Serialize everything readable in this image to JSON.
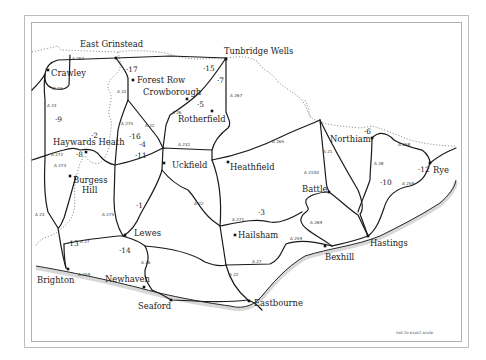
{
  "map": {
    "title": "East Sussex area map",
    "scale_note": "not to exact scale",
    "towns": [
      {
        "name": "East Grinstead",
        "x": 80,
        "y": 47
      },
      {
        "name": "Tunbridge Wells",
        "x": 224,
        "y": 54
      },
      {
        "name": "Crawley",
        "x": 51,
        "y": 76
      },
      {
        "name": "Forest Row",
        "x": 137,
        "y": 83
      },
      {
        "name": "Crowborough",
        "x": 143,
        "y": 95
      },
      {
        "name": "Rotherfield",
        "x": 178,
        "y": 122
      },
      {
        "name": "Haywards Heath",
        "x": 53,
        "y": 145
      },
      {
        "name": "Uckfield",
        "x": 172,
        "y": 168
      },
      {
        "name": "Heathfield",
        "x": 230,
        "y": 170
      },
      {
        "name": "Burgess",
        "x": 73,
        "y": 183
      },
      {
        "name": "Hill",
        "x": 82,
        "y": 193
      },
      {
        "name": "Northiam",
        "x": 330,
        "y": 142
      },
      {
        "name": "Rye",
        "x": 433,
        "y": 173
      },
      {
        "name": "Battle",
        "x": 302,
        "y": 192
      },
      {
        "name": "Lewes",
        "x": 134,
        "y": 236
      },
      {
        "name": "Hailsham",
        "x": 238,
        "y": 238
      },
      {
        "name": "Hastings",
        "x": 370,
        "y": 246
      },
      {
        "name": "Bexhill",
        "x": 325,
        "y": 260
      },
      {
        "name": "Brighton",
        "x": 37,
        "y": 283
      },
      {
        "name": "Newhaven",
        "x": 105,
        "y": 282
      },
      {
        "name": "Seaford",
        "x": 138,
        "y": 309
      },
      {
        "name": "Eastbourne",
        "x": 254,
        "y": 306
      }
    ],
    "town_markers": [
      {
        "x": 116,
        "y": 58
      },
      {
        "x": 226,
        "y": 59
      },
      {
        "x": 48,
        "y": 70
      },
      {
        "x": 133,
        "y": 80
      },
      {
        "x": 187,
        "y": 99
      },
      {
        "x": 212,
        "y": 111
      },
      {
        "x": 86,
        "y": 152
      },
      {
        "x": 164,
        "y": 163
      },
      {
        "x": 228,
        "y": 162
      },
      {
        "x": 70,
        "y": 176
      },
      {
        "x": 372,
        "y": 138
      },
      {
        "x": 430,
        "y": 163
      },
      {
        "x": 329,
        "y": 192
      },
      {
        "x": 125,
        "y": 235
      },
      {
        "x": 235,
        "y": 235
      },
      {
        "x": 368,
        "y": 236
      },
      {
        "x": 325,
        "y": 246
      },
      {
        "x": 68,
        "y": 269
      },
      {
        "x": 144,
        "y": 287
      },
      {
        "x": 171,
        "y": 300
      },
      {
        "x": 249,
        "y": 301
      }
    ],
    "numbers": [
      {
        "label": "1",
        "x": 136,
        "y": 208
      },
      {
        "label": "2",
        "x": 91,
        "y": 138
      },
      {
        "label": "3",
        "x": 258,
        "y": 215
      },
      {
        "label": "4",
        "x": 139,
        "y": 147
      },
      {
        "label": "5",
        "x": 197,
        "y": 107
      },
      {
        "label": "6",
        "x": 364,
        "y": 134
      },
      {
        "label": "7",
        "x": 217,
        "y": 83
      },
      {
        "label": "8",
        "x": 76,
        "y": 157
      },
      {
        "label": "9",
        "x": 55,
        "y": 122
      },
      {
        "label": "10",
        "x": 380,
        "y": 185
      },
      {
        "label": "11",
        "x": 135,
        "y": 158
      },
      {
        "label": "12",
        "x": 418,
        "y": 172
      },
      {
        "label": "13",
        "x": 67,
        "y": 246
      },
      {
        "label": "14",
        "x": 119,
        "y": 253
      },
      {
        "label": "15",
        "x": 203,
        "y": 71
      },
      {
        "label": "16",
        "x": 129,
        "y": 139
      },
      {
        "label": "17",
        "x": 126,
        "y": 72
      }
    ],
    "road_labels": [
      {
        "label": "A 264",
        "x": 72,
        "y": 60
      },
      {
        "label": "M 23",
        "x": 52,
        "y": 90
      },
      {
        "label": "A 23",
        "x": 47,
        "y": 107
      },
      {
        "label": "A 22",
        "x": 117,
        "y": 93
      },
      {
        "label": "A 26",
        "x": 172,
        "y": 114
      },
      {
        "label": "A 267",
        "x": 230,
        "y": 97
      },
      {
        "label": "A 275",
        "x": 121,
        "y": 125
      },
      {
        "label": "A 22",
        "x": 145,
        "y": 127
      },
      {
        "label": "A 232",
        "x": 178,
        "y": 146
      },
      {
        "label": "A 265",
        "x": 272,
        "y": 143
      },
      {
        "label": "A 272",
        "x": 51,
        "y": 156
      },
      {
        "label": "A 273",
        "x": 54,
        "y": 167
      },
      {
        "label": "A 21",
        "x": 323,
        "y": 153
      },
      {
        "label": "A 28",
        "x": 374,
        "y": 165
      },
      {
        "label": "A 2100",
        "x": 304,
        "y": 174
      },
      {
        "label": "A 268",
        "x": 398,
        "y": 146
      },
      {
        "label": "A 259",
        "x": 402,
        "y": 185
      },
      {
        "label": "A 22",
        "x": 194,
        "y": 205
      },
      {
        "label": "A 271",
        "x": 232,
        "y": 221
      },
      {
        "label": "A 269",
        "x": 310,
        "y": 224
      },
      {
        "label": "A 23",
        "x": 35,
        "y": 216
      },
      {
        "label": "A 275",
        "x": 102,
        "y": 216
      },
      {
        "label": "A 27",
        "x": 80,
        "y": 243
      },
      {
        "label": "A 259",
        "x": 290,
        "y": 240
      },
      {
        "label": "A 26",
        "x": 141,
        "y": 264
      },
      {
        "label": "A 27",
        "x": 252,
        "y": 263
      },
      {
        "label": "A 22",
        "x": 229,
        "y": 276
      },
      {
        "label": "A 259",
        "x": 78,
        "y": 276
      }
    ]
  }
}
